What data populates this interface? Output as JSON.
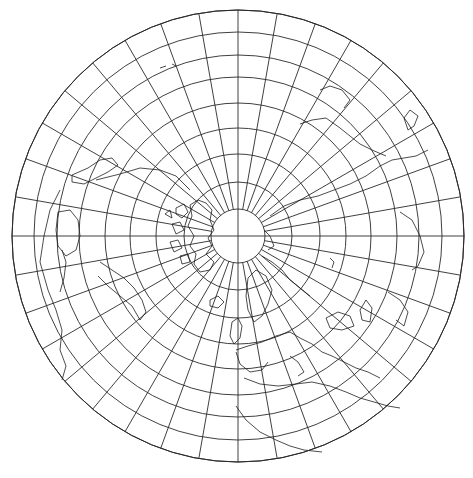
{
  "map": {
    "type": "polar azimuthal equidistant (north polar)",
    "width": 473,
    "height": 478,
    "center": [
      238,
      236
    ],
    "outer_radius": 226,
    "inner_radius": 27,
    "parallel_spacing_deg": 10,
    "meridian_spacing_deg": 10,
    "parallels_deg": [
      80,
      70,
      60,
      50,
      40,
      30,
      20,
      10,
      0
    ],
    "parallel_radii_px": [
      27,
      54,
      82,
      108,
      133,
      159,
      181,
      204,
      226
    ],
    "meridian_count": 36,
    "colors": {
      "background": "#ffffff",
      "graticule": "#2a2a2a",
      "coastline": "#1e1e1e"
    },
    "features": [
      "graticule",
      "coastlines",
      "polar cap (blank)"
    ],
    "regions_visible": [
      "North America",
      "Greenland",
      "Europe",
      "North Africa",
      "Asia",
      "Arctic Ocean"
    ]
  }
}
